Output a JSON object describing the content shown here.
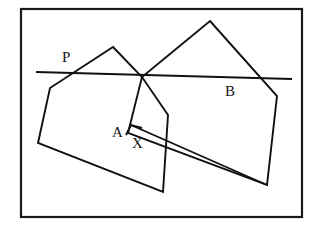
{
  "figure": {
    "background_color": "#ffffff",
    "ink_color": "#111111",
    "frame": {
      "x": 21,
      "y": 9,
      "width": 281,
      "height": 208,
      "stroke_color": "#1a1a1a",
      "stroke_width": 2.2
    },
    "labels": [
      {
        "id": "P",
        "text": "P",
        "x": 62,
        "y": 50,
        "description": "intersection point of line with polygon A upper-left edge"
      },
      {
        "id": "A",
        "text": "A",
        "x": 112,
        "y": 125,
        "description": "name of the left polygon"
      },
      {
        "id": "X",
        "text": "X",
        "x": 132,
        "y": 136,
        "description": "point indicated by the arrow"
      },
      {
        "id": "B",
        "text": "B",
        "x": 225,
        "y": 84,
        "description": "name of the right polygon"
      }
    ],
    "shapes": {
      "polygon_a": {
        "name": "polygon-a",
        "closed": true,
        "points": [
          [
            113,
            47
          ],
          [
            142,
            77
          ],
          [
            168,
            115
          ],
          [
            163,
            192
          ],
          [
            38,
            143
          ],
          [
            50,
            88
          ]
        ]
      },
      "polygon_b": {
        "name": "polygon-b",
        "closed": true,
        "points": [
          [
            210,
            21
          ],
          [
            277,
            96
          ],
          [
            267,
            185
          ],
          [
            128,
            133
          ],
          [
            142,
            77
          ]
        ]
      },
      "cut_line": {
        "name": "cut-line",
        "from": [
          36,
          72
        ],
        "to": [
          292,
          79
        ]
      },
      "arrow": {
        "name": "arrow-to-x",
        "tail": [
          267,
          185
        ],
        "tip": [
          131,
          125
        ],
        "head_left": [
          126,
          135
        ],
        "head_right": [
          142,
          128
        ]
      }
    }
  }
}
